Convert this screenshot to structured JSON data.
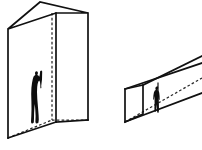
{
  "diagram": {
    "background_color": "#ffffff",
    "line_color": "#111111",
    "hidden_line_color": "#2a2a2a",
    "figure_color": "#0d0d0d",
    "shapes": [
      {
        "id": "tall-slab",
        "name": "Tall vertical rectangular prism",
        "label": "",
        "orientation": "vertical",
        "projection": "oblique",
        "has_hidden_edges": true,
        "contains_human_figure": true,
        "human_pose": "standing with one arm raised overhead"
      },
      {
        "id": "horizontal-beam",
        "name": "Horizontal rectangular prism beam",
        "label": "",
        "orientation": "horizontal",
        "projection": "oblique",
        "has_hidden_edges": true,
        "contains_human_figure": true,
        "human_pose": "standing upright"
      }
    ],
    "figures": [
      {
        "id": "figure-left",
        "shape": "tall-slab",
        "description": "human silhouette for scale"
      },
      {
        "id": "figure-right",
        "shape": "horizontal-beam",
        "description": "human silhouette for scale"
      }
    ]
  }
}
